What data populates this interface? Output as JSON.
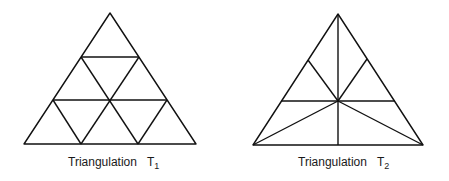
{
  "figures": [
    {
      "id": "T1",
      "caption": "Triangulation",
      "symbol": "T",
      "subscript": "1",
      "description": "Equilateral triangle subdivided into 9 congruent triangles"
    },
    {
      "id": "T2",
      "caption": "Triangulation",
      "symbol": "T",
      "subscript": "2",
      "description": "Equilateral triangle subdivided by lines through the centroid"
    }
  ],
  "colors": {
    "stroke": "#111111",
    "background": "#ffffff"
  }
}
